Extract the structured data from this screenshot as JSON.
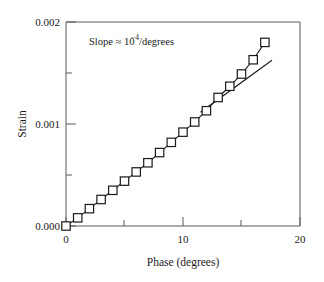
{
  "chart_data": {
    "type": "line",
    "title": "",
    "xlabel": "Phase (degrees)",
    "ylabel": "Strain",
    "xlim": [
      0,
      20
    ],
    "ylim": [
      0,
      0.002
    ],
    "grid": false,
    "legend": null,
    "x_major_ticks": [
      0,
      10,
      20
    ],
    "x_major_tick_labels": [
      "0",
      "10",
      "20"
    ],
    "x_minor_ticks": [
      5,
      15
    ],
    "y_major_ticks": [
      0.0,
      0.001,
      0.002
    ],
    "y_major_tick_labels": [
      "0.000",
      "0.001",
      "0.002"
    ],
    "y_minor_ticks": [
      0.0005,
      0.0015
    ],
    "marker_style": "open-square",
    "series": [
      {
        "name": "Strain vs Phase",
        "x": [
          0,
          1,
          2,
          3,
          4,
          5,
          6,
          7,
          8,
          9,
          10,
          11,
          12,
          13,
          14,
          15,
          16,
          17
        ],
        "values": [
          0.0,
          8e-05,
          0.00017,
          0.00026,
          0.00035,
          0.00044,
          0.00053,
          0.00062,
          0.00072,
          0.00082,
          0.00092,
          0.00102,
          0.00113,
          0.00126,
          0.00137,
          0.00149,
          0.00163,
          0.0018
        ]
      }
    ],
    "fit_line": {
      "name": "linear reference",
      "slope": 0.0001,
      "x_start": 11.5,
      "y_start": 0.001115,
      "x_end": 17.6,
      "y_end": 0.001625
    },
    "annotations": [
      {
        "name": "slope-annotation",
        "prefix": "Slope ≈ 10",
        "exponent": "−4",
        "suffix": "/degrees",
        "x": 4.0,
        "y": 0.00182
      }
    ]
  }
}
